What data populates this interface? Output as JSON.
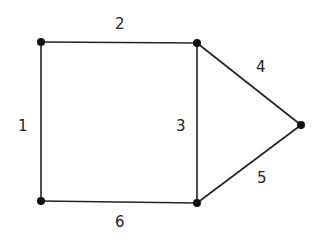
{
  "diagram": {
    "type": "graph",
    "nodes": [
      {
        "id": "A",
        "x": 41,
        "y": 42
      },
      {
        "id": "B",
        "x": 197,
        "y": 43
      },
      {
        "id": "C",
        "x": 301,
        "y": 125
      },
      {
        "id": "D",
        "x": 41,
        "y": 201
      },
      {
        "id": "E",
        "x": 197,
        "y": 203
      }
    ],
    "edges": [
      {
        "label": "1",
        "from": "A",
        "to": "D"
      },
      {
        "label": "2",
        "from": "A",
        "to": "B"
      },
      {
        "label": "3",
        "from": "B",
        "to": "E"
      },
      {
        "label": "4",
        "from": "B",
        "to": "C"
      },
      {
        "label": "5",
        "from": "E",
        "to": "C"
      },
      {
        "label": "6",
        "from": "D",
        "to": "E"
      }
    ],
    "line_color": "#222222",
    "node_color": "#111111"
  }
}
